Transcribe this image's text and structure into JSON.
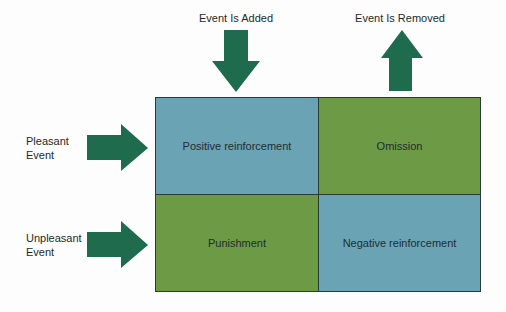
{
  "columns": [
    {
      "label": "Event Is Added",
      "arrow": "down-arrow"
    },
    {
      "label": "Event Is Removed",
      "arrow": "up-arrow"
    }
  ],
  "rows": [
    {
      "label_line1": "Pleasant",
      "label_line2": "Event",
      "arrow": "right-arrow"
    },
    {
      "label_line1": "Unpleasant",
      "label_line2": "Event",
      "arrow": "right-arrow"
    }
  ],
  "cells": {
    "pleasant_added": "Positive reinforcement",
    "pleasant_removed": "Omission",
    "unpleasant_added": "Punishment",
    "unpleasant_removed": "Negative reinforcement"
  },
  "colors": {
    "arrow": "#1e6b4e",
    "blue_cell": "#6aa3b3",
    "green_cell": "#6c9a45"
  }
}
